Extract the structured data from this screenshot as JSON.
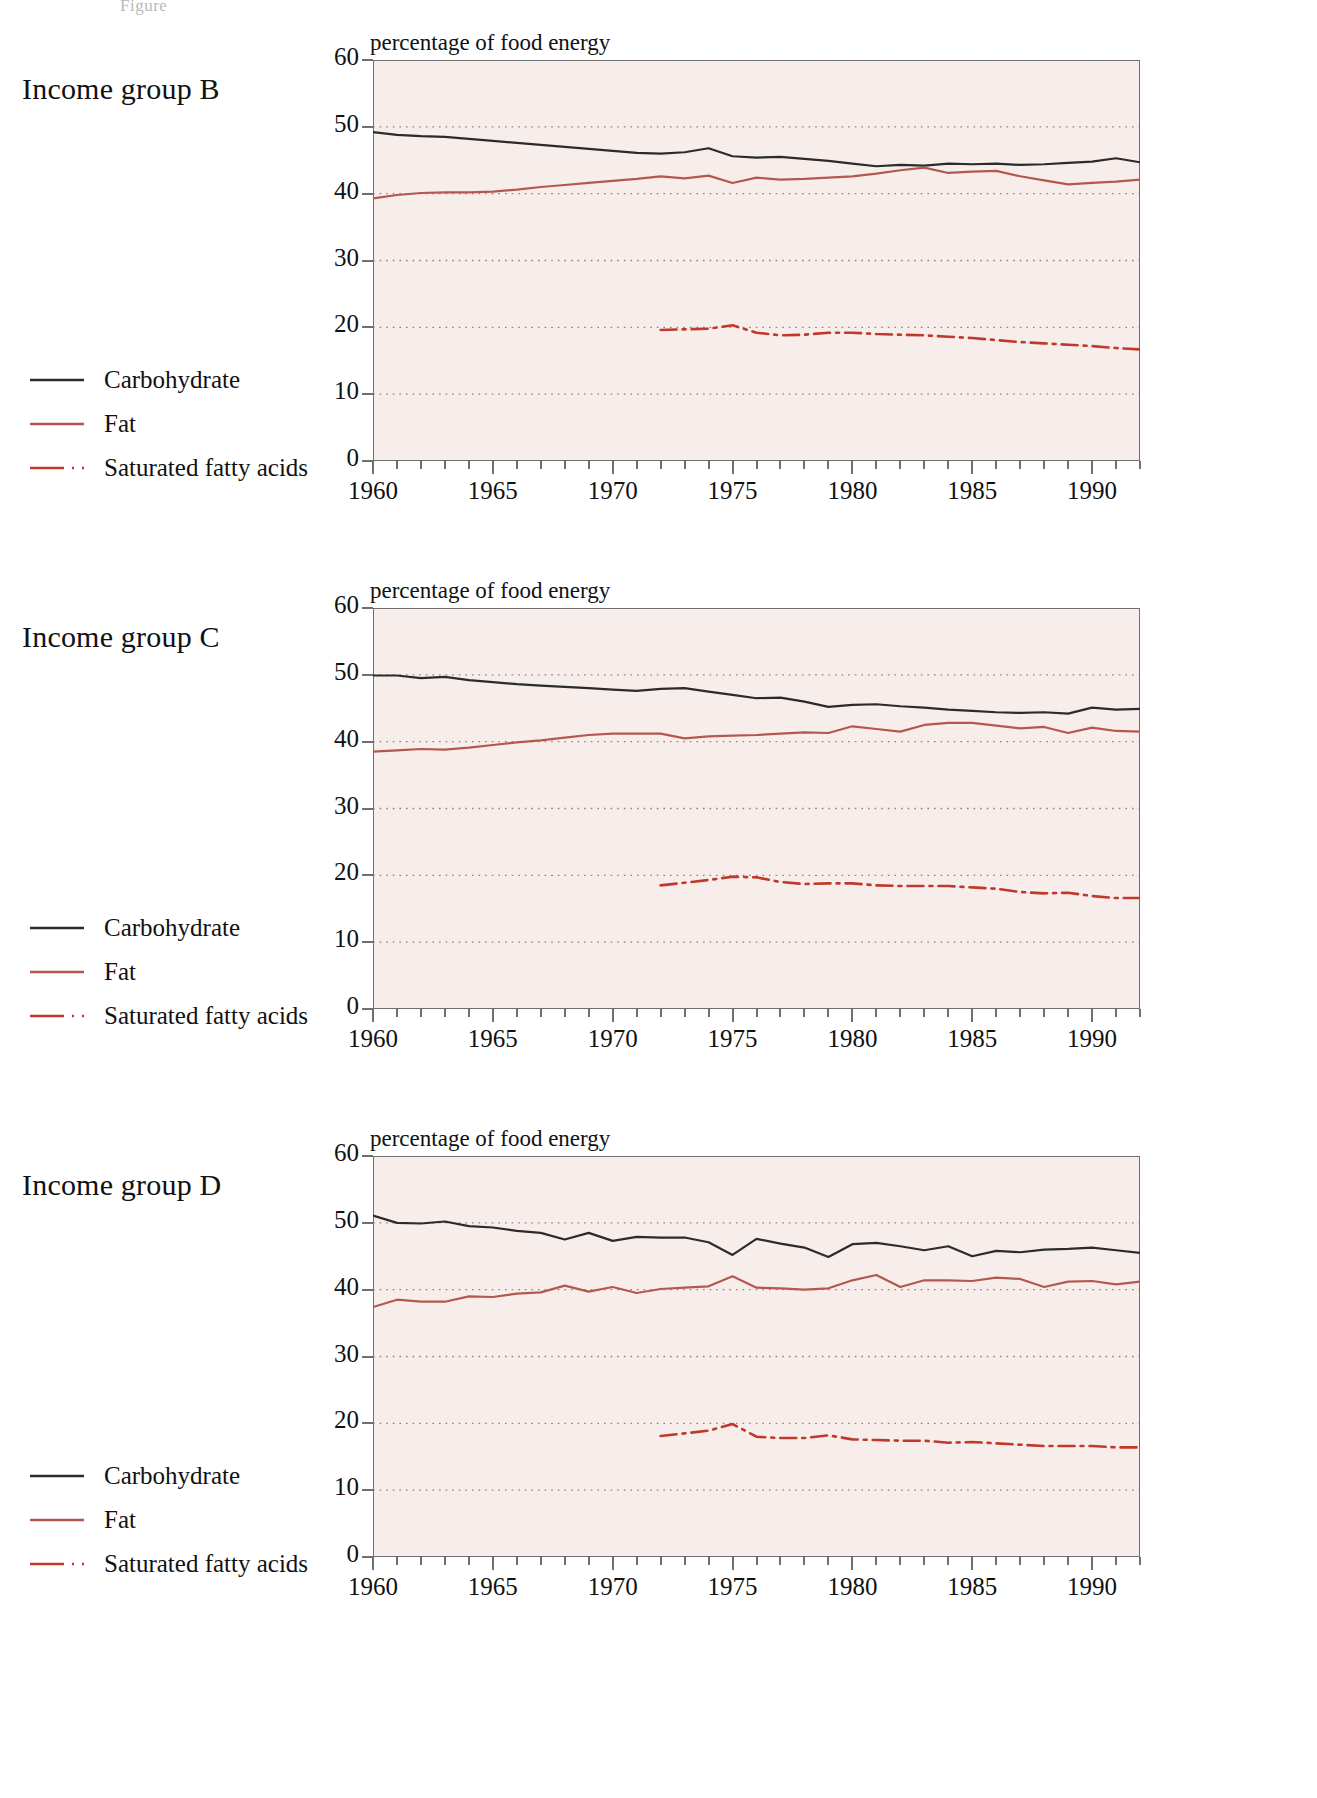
{
  "figure": {
    "caption": "Figure"
  },
  "colors": {
    "carbohydrate": "#2b2b2b",
    "fat": "#b4584f",
    "saturated": "#c0392b",
    "plot_background": "#f7eeec",
    "grid": "#8a6a66",
    "axis": "#6f6f6f"
  },
  "legend": {
    "items": [
      {
        "label": "Carbohydrate",
        "style": "solid",
        "color": "#2b2b2b",
        "name": "legend-carbohydrate"
      },
      {
        "label": "Fat",
        "style": "solid",
        "color": "#b4584f",
        "name": "legend-fat"
      },
      {
        "label": "Saturated fatty acids",
        "style": "dashdot",
        "color": "#c0392b",
        "name": "legend-saturated-fatty-acids"
      }
    ]
  },
  "panels": [
    {
      "title": "Income group B"
    },
    {
      "title": "Income group C"
    },
    {
      "title": "Income group D"
    }
  ],
  "chart_data": [
    {
      "type": "line",
      "title": "Income group B",
      "ylabel": "percentage of food energy",
      "xlabel": "",
      "ylim": [
        0,
        60
      ],
      "xlim": [
        1960,
        1992
      ],
      "yticks": [
        0,
        10,
        20,
        30,
        40,
        50,
        60
      ],
      "xticks": [
        1960,
        1965,
        1970,
        1975,
        1980,
        1985,
        1990
      ],
      "grid": true,
      "legend_position": "left-outside",
      "x": [
        1960,
        1961,
        1962,
        1963,
        1964,
        1965,
        1966,
        1967,
        1968,
        1969,
        1970,
        1971,
        1972,
        1973,
        1974,
        1975,
        1976,
        1977,
        1978,
        1979,
        1980,
        1981,
        1982,
        1983,
        1984,
        1985,
        1986,
        1987,
        1988,
        1989,
        1990,
        1991,
        1992
      ],
      "series": [
        {
          "name": "Carbohydrate",
          "style": "solid",
          "color": "#2b2b2b",
          "values": [
            49.2,
            48.8,
            48.6,
            48.5,
            48.2,
            47.9,
            47.6,
            47.3,
            47.0,
            46.7,
            46.4,
            46.1,
            46.0,
            46.2,
            46.8,
            45.6,
            45.4,
            45.5,
            45.2,
            44.9,
            44.5,
            44.1,
            44.3,
            44.2,
            44.5,
            44.4,
            44.5,
            44.3,
            44.4,
            44.6,
            44.8,
            45.3,
            44.7
          ]
        },
        {
          "name": "Fat",
          "style": "solid",
          "color": "#b4584f",
          "values": [
            39.3,
            39.8,
            40.1,
            40.2,
            40.2,
            40.3,
            40.6,
            41.0,
            41.3,
            41.6,
            41.9,
            42.2,
            42.6,
            42.3,
            42.7,
            41.6,
            42.4,
            42.1,
            42.2,
            42.4,
            42.6,
            43.0,
            43.5,
            43.9,
            43.1,
            43.3,
            43.4,
            42.6,
            42.0,
            41.4,
            41.6,
            41.8,
            42.1
          ]
        },
        {
          "name": "Saturated fatty acids",
          "style": "dashdot",
          "color": "#c0392b",
          "values": [
            null,
            null,
            null,
            null,
            null,
            null,
            null,
            null,
            null,
            null,
            null,
            null,
            19.6,
            19.7,
            19.8,
            20.3,
            19.2,
            18.8,
            18.9,
            19.2,
            19.2,
            19.0,
            18.9,
            18.8,
            18.6,
            18.4,
            18.1,
            17.8,
            17.6,
            17.4,
            17.2,
            16.9,
            16.7
          ]
        }
      ]
    },
    {
      "type": "line",
      "title": "Income group C",
      "ylabel": "percentage of food energy",
      "xlabel": "",
      "ylim": [
        0,
        60
      ],
      "xlim": [
        1960,
        1992
      ],
      "yticks": [
        0,
        10,
        20,
        30,
        40,
        50,
        60
      ],
      "xticks": [
        1960,
        1965,
        1970,
        1975,
        1980,
        1985,
        1990
      ],
      "grid": true,
      "legend_position": "left-outside",
      "x": [
        1960,
        1961,
        1962,
        1963,
        1964,
        1965,
        1966,
        1967,
        1968,
        1969,
        1970,
        1971,
        1972,
        1973,
        1974,
        1975,
        1976,
        1977,
        1978,
        1979,
        1980,
        1981,
        1982,
        1983,
        1984,
        1985,
        1986,
        1987,
        1988,
        1989,
        1990,
        1991,
        1992
      ],
      "series": [
        {
          "name": "Carbohydrate",
          "style": "solid",
          "color": "#2b2b2b",
          "values": [
            49.9,
            49.9,
            49.5,
            49.7,
            49.2,
            48.9,
            48.6,
            48.4,
            48.2,
            48.0,
            47.8,
            47.6,
            47.9,
            48.0,
            47.5,
            47.0,
            46.5,
            46.6,
            46.0,
            45.2,
            45.5,
            45.6,
            45.3,
            45.1,
            44.8,
            44.6,
            44.4,
            44.3,
            44.4,
            44.2,
            45.1,
            44.8,
            44.9
          ]
        },
        {
          "name": "Fat",
          "style": "solid",
          "color": "#b4584f",
          "values": [
            38.5,
            38.7,
            38.9,
            38.8,
            39.1,
            39.5,
            39.9,
            40.2,
            40.6,
            41.0,
            41.2,
            41.2,
            41.2,
            40.5,
            40.8,
            40.9,
            41.0,
            41.2,
            41.4,
            41.3,
            42.3,
            41.9,
            41.5,
            42.5,
            42.8,
            42.8,
            42.4,
            42.0,
            42.2,
            41.3,
            42.1,
            41.6,
            41.5
          ]
        },
        {
          "name": "Saturated fatty acids",
          "style": "dashdot",
          "color": "#c0392b",
          "values": [
            null,
            null,
            null,
            null,
            null,
            null,
            null,
            null,
            null,
            null,
            null,
            null,
            18.5,
            18.9,
            19.3,
            19.8,
            19.7,
            19.0,
            18.7,
            18.8,
            18.8,
            18.5,
            18.4,
            18.4,
            18.4,
            18.2,
            18.0,
            17.5,
            17.3,
            17.4,
            16.9,
            16.6,
            16.6
          ]
        }
      ]
    },
    {
      "type": "line",
      "title": "Income group D",
      "ylabel": "percentage of food energy",
      "xlabel": "",
      "ylim": [
        0,
        60
      ],
      "xlim": [
        1960,
        1992
      ],
      "yticks": [
        0,
        10,
        20,
        30,
        40,
        50,
        60
      ],
      "xticks": [
        1960,
        1965,
        1970,
        1975,
        1980,
        1985,
        1990
      ],
      "grid": true,
      "legend_position": "left-outside",
      "x": [
        1960,
        1961,
        1962,
        1963,
        1964,
        1965,
        1966,
        1967,
        1968,
        1969,
        1970,
        1971,
        1972,
        1973,
        1974,
        1975,
        1976,
        1977,
        1978,
        1979,
        1980,
        1981,
        1982,
        1983,
        1984,
        1985,
        1986,
        1987,
        1988,
        1989,
        1990,
        1991,
        1992
      ],
      "series": [
        {
          "name": "Carbohydrate",
          "style": "solid",
          "color": "#2b2b2b",
          "values": [
            51.1,
            50.0,
            49.9,
            50.2,
            49.5,
            49.3,
            48.8,
            48.5,
            47.5,
            48.5,
            47.3,
            47.9,
            47.8,
            47.8,
            47.1,
            45.2,
            47.6,
            46.9,
            46.3,
            44.9,
            46.8,
            47.0,
            46.5,
            45.9,
            46.5,
            45.0,
            45.8,
            45.6,
            46.0,
            46.1,
            46.3,
            45.9,
            45.5
          ]
        },
        {
          "name": "Fat",
          "style": "solid",
          "color": "#b4584f",
          "values": [
            37.4,
            38.5,
            38.2,
            38.2,
            39.0,
            38.9,
            39.4,
            39.6,
            40.6,
            39.7,
            40.4,
            39.5,
            40.1,
            40.3,
            40.5,
            42.0,
            40.3,
            40.2,
            40.0,
            40.2,
            41.4,
            42.2,
            40.4,
            41.4,
            41.4,
            41.3,
            41.8,
            41.6,
            40.4,
            41.2,
            41.3,
            40.8,
            41.2
          ]
        },
        {
          "name": "Saturated fatty acids",
          "style": "dashdot",
          "color": "#c0392b",
          "values": [
            null,
            null,
            null,
            null,
            null,
            null,
            null,
            null,
            null,
            null,
            null,
            null,
            18.1,
            18.5,
            18.9,
            19.9,
            18.0,
            17.8,
            17.8,
            18.2,
            17.6,
            17.5,
            17.4,
            17.4,
            17.1,
            17.2,
            17.0,
            16.8,
            16.6,
            16.6,
            16.6,
            16.4,
            16.4
          ]
        }
      ]
    }
  ]
}
